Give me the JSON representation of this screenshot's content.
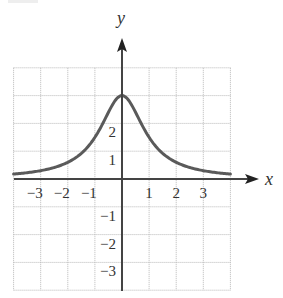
{
  "chart_data": {
    "type": "line",
    "title": "",
    "function": "y = 3 / (1 + x^2)",
    "xlabel": "x",
    "ylabel": "y",
    "xlim": [
      -4,
      4
    ],
    "ylim": [
      -4,
      4
    ],
    "grid": true,
    "grid_style": "dotted",
    "x_ticks": [
      -3,
      -2,
      -1,
      1,
      2,
      3
    ],
    "x_tick_labels": [
      "−3",
      "−2",
      "−1",
      "1",
      "2",
      "3"
    ],
    "y_ticks": [
      -3,
      -2,
      -1,
      1,
      2
    ],
    "y_tick_labels": [
      "−3",
      "−2",
      "−1",
      "1",
      "2"
    ],
    "series": [
      {
        "name": "curve",
        "x": [
          -4,
          -3.5,
          -3,
          -2.5,
          -2,
          -1.5,
          -1,
          -0.5,
          0,
          0.5,
          1,
          1.5,
          2,
          2.5,
          3,
          3.5,
          4
        ],
        "y": [
          0.18,
          0.23,
          0.3,
          0.41,
          0.6,
          0.92,
          1.5,
          2.4,
          3.0,
          2.4,
          1.5,
          0.92,
          0.6,
          0.41,
          0.3,
          0.23,
          0.18
        ]
      }
    ],
    "colors": {
      "curve": "#5a5a5a",
      "axes": "#444444",
      "grid": "#b8b8b8"
    }
  }
}
